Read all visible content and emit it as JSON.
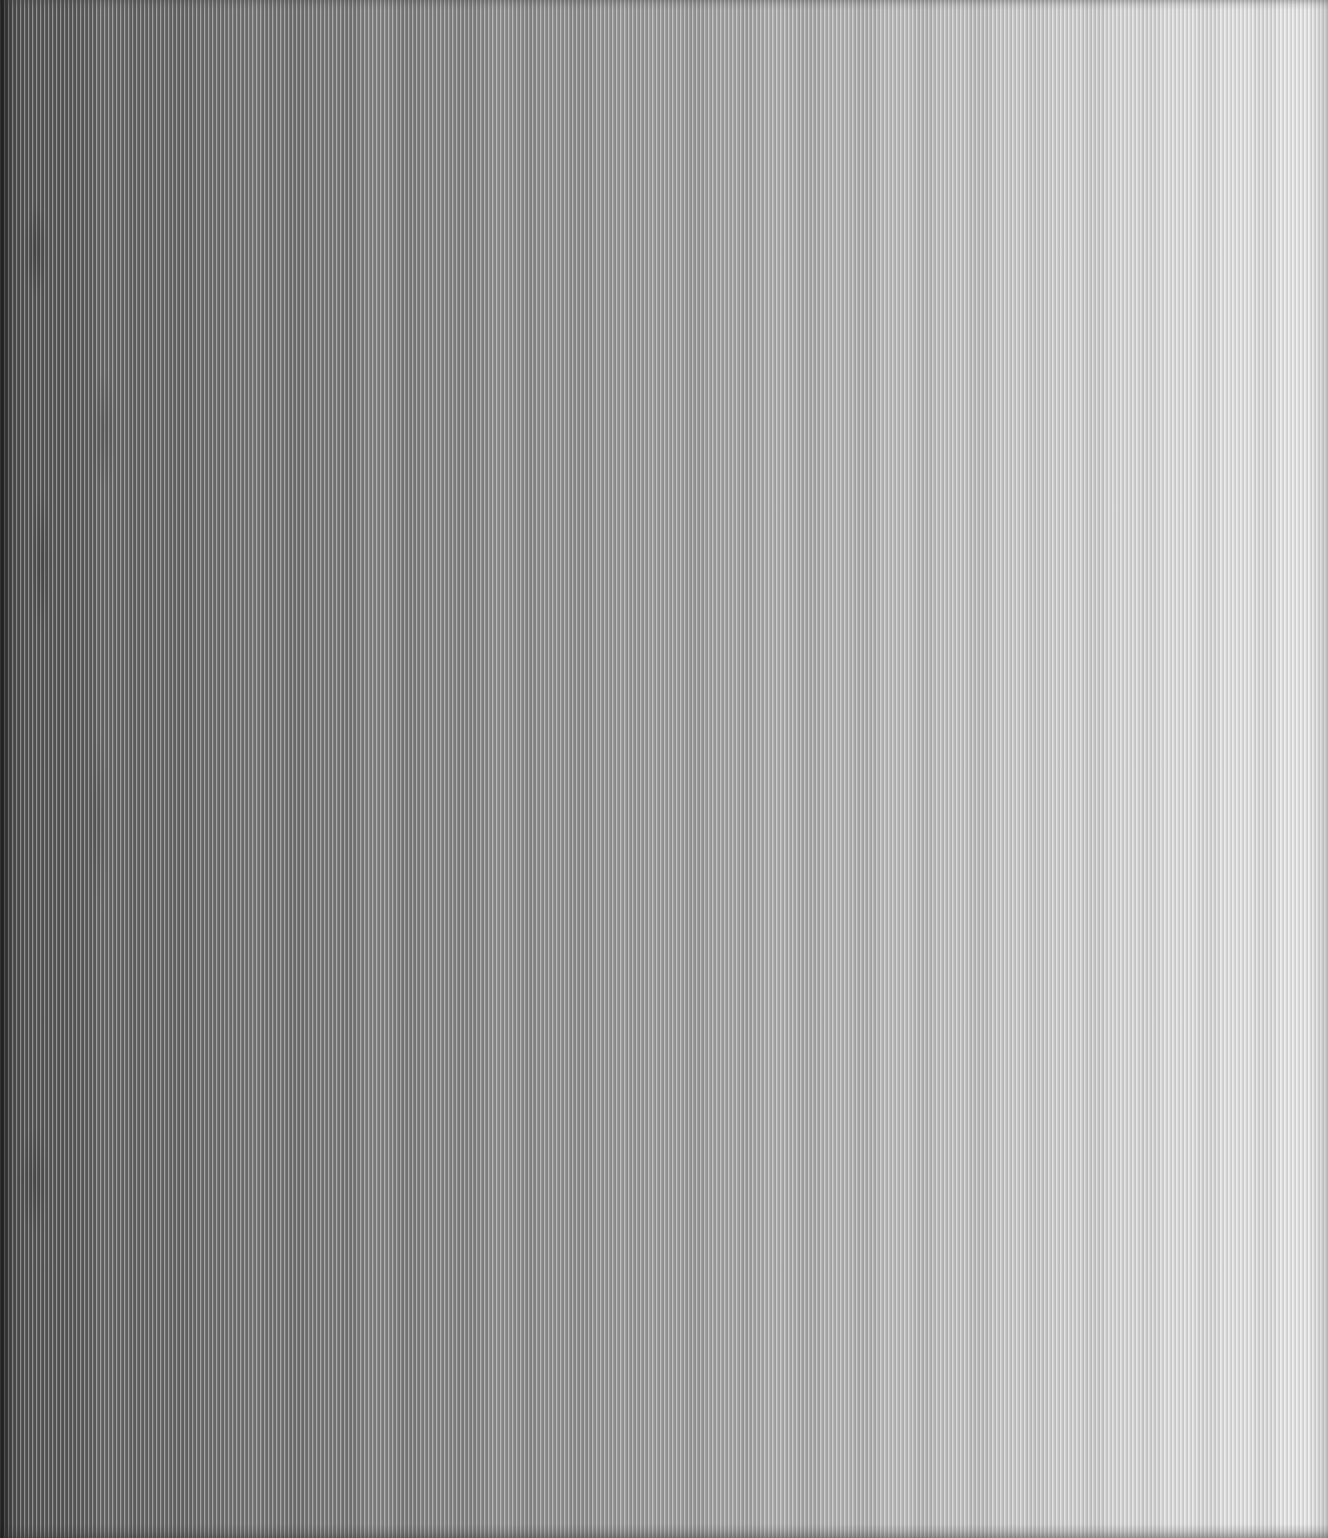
{
  "image": {
    "description": "Full-frame monochrome close-up of a finely ribbed vertical-stripe texture (scan-like surface) with brightness increasing from dark gray at the left edge to near-white at the right edge; no text or interface elements are visible.",
    "texture": {
      "stripe_period_px": 4,
      "stripe_orientation": "vertical",
      "gradient_direction": "left-dark-to-right-light",
      "gradient_stops": [
        "#303030",
        "#505050",
        "#5e5e5e",
        "#6d6d6d",
        "#7b7b7b",
        "#8a8a8a",
        "#9b9b9b",
        "#b3b3b3",
        "#cccccc",
        "#dfdfdf",
        "#e7e7e7"
      ],
      "stripe_light_color": "rgba(255,255,255,0.38)",
      "stripe_dark_color": "rgba(25,25,25,0.14)",
      "right_edge_color": "rgba(150,150,150,0.38)"
    }
  }
}
